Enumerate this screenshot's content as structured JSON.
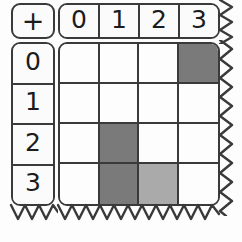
{
  "worksheet": {
    "title": "Addition Table",
    "operator": {
      "symbol": "+",
      "name": "plus-sign"
    },
    "column_headers": [
      "0",
      "1",
      "2",
      "3"
    ],
    "row_headers": [
      "0",
      "1",
      "2",
      "3"
    ],
    "colors": {
      "ink": "#3a3a3a",
      "text": "#1c1c1c",
      "paper": "#fdfdfd",
      "header_fill": "#fbfbfb",
      "shade_dark": "#7a7a7a",
      "shade_light": "#aaaaaa"
    },
    "grid": {
      "rows": 4,
      "columns": 4,
      "cells": [
        [
          {
            "value": "",
            "shade": "none"
          },
          {
            "value": "",
            "shade": "none"
          },
          {
            "value": "",
            "shade": "none"
          },
          {
            "value": "",
            "shade": "dark"
          }
        ],
        [
          {
            "value": "",
            "shade": "none"
          },
          {
            "value": "",
            "shade": "none"
          },
          {
            "value": "",
            "shade": "none"
          },
          {
            "value": "",
            "shade": "none"
          }
        ],
        [
          {
            "value": "",
            "shade": "none"
          },
          {
            "value": "",
            "shade": "dark"
          },
          {
            "value": "",
            "shade": "none"
          },
          {
            "value": "",
            "shade": "none"
          }
        ],
        [
          {
            "value": "",
            "shade": "none"
          },
          {
            "value": "",
            "shade": "dark"
          },
          {
            "value": "",
            "shade": "light"
          },
          {
            "value": "",
            "shade": "none"
          }
        ]
      ]
    },
    "torn_edges": [
      "right",
      "bottom"
    ]
  }
}
